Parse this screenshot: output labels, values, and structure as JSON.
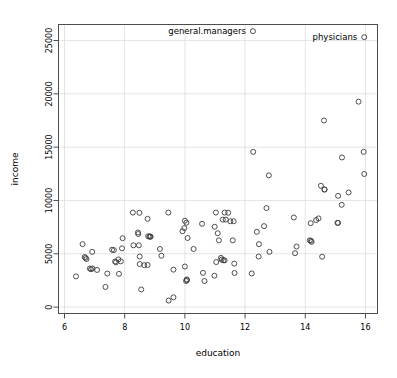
{
  "chart_data": {
    "type": "scatter",
    "title": "",
    "xlabel": "education",
    "ylabel": "income",
    "xlim": [
      5.8,
      16.4
    ],
    "ylim": [
      -600,
      26500
    ],
    "grid": true,
    "legend": "none",
    "xticks": [
      "6",
      "8",
      "10",
      "12",
      "14",
      "16"
    ],
    "xtick_values": [
      6,
      8,
      10,
      12,
      14,
      16
    ],
    "yticks": [
      "0",
      "5000",
      "10000",
      "15000",
      "20000",
      "25000"
    ],
    "ytick_values": [
      0,
      5000,
      10000,
      15000,
      20000,
      25000
    ],
    "marker": "open-circle",
    "marker_color": "#3c3c3c",
    "grid_color": "#d9d9d9",
    "frame_color": "#4d4d4d",
    "annotations": [
      {
        "text": "general.managers",
        "x": 12.26,
        "y": 25879
      },
      {
        "text": "physicians",
        "x": 15.96,
        "y": 25308
      }
    ],
    "points": [
      {
        "x": 12.26,
        "y": 25879
      },
      {
        "x": 15.96,
        "y": 25308
      },
      {
        "x": 15.77,
        "y": 19263
      },
      {
        "x": 14.62,
        "y": 17498
      },
      {
        "x": 12.27,
        "y": 14558
      },
      {
        "x": 15.94,
        "y": 14558
      },
      {
        "x": 15.22,
        "y": 14032
      },
      {
        "x": 12.79,
        "y": 12351
      },
      {
        "x": 15.96,
        "y": 12480
      },
      {
        "x": 14.52,
        "y": 11377
      },
      {
        "x": 14.64,
        "y": 11023
      },
      {
        "x": 14.64,
        "y": 11030
      },
      {
        "x": 15.09,
        "y": 10432
      },
      {
        "x": 15.44,
        "y": 10748
      },
      {
        "x": 15.21,
        "y": 9593
      },
      {
        "x": 12.71,
        "y": 9284
      },
      {
        "x": 11.03,
        "y": 8865
      },
      {
        "x": 11.32,
        "y": 8865
      },
      {
        "x": 11.44,
        "y": 8845
      },
      {
        "x": 8.27,
        "y": 8865
      },
      {
        "x": 8.49,
        "y": 8845
      },
      {
        "x": 9.45,
        "y": 8865
      },
      {
        "x": 13.62,
        "y": 8403
      },
      {
        "x": 8.76,
        "y": 8280
      },
      {
        "x": 10.0,
        "y": 8100
      },
      {
        "x": 10.05,
        "y": 7914
      },
      {
        "x": 14.44,
        "y": 8316
      },
      {
        "x": 14.36,
        "y": 8163
      },
      {
        "x": 14.18,
        "y": 7870
      },
      {
        "x": 11.51,
        "y": 8049
      },
      {
        "x": 11.62,
        "y": 8049
      },
      {
        "x": 11.26,
        "y": 8202
      },
      {
        "x": 11.36,
        "y": 8202
      },
      {
        "x": 10.57,
        "y": 7811
      },
      {
        "x": 15.07,
        "y": 7902
      },
      {
        "x": 15.09,
        "y": 7894
      },
      {
        "x": 10.99,
        "y": 7534
      },
      {
        "x": 9.98,
        "y": 7405
      },
      {
        "x": 9.92,
        "y": 7113
      },
      {
        "x": 12.39,
        "y": 7059
      },
      {
        "x": 12.63,
        "y": 7595
      },
      {
        "x": 8.44,
        "y": 6998
      },
      {
        "x": 8.45,
        "y": 6853
      },
      {
        "x": 8.78,
        "y": 6640
      },
      {
        "x": 8.82,
        "y": 6607
      },
      {
        "x": 8.85,
        "y": 6621
      },
      {
        "x": 8.86,
        "y": 6598
      },
      {
        "x": 11.09,
        "y": 6929
      },
      {
        "x": 14.15,
        "y": 6258
      },
      {
        "x": 14.21,
        "y": 6112
      },
      {
        "x": 14.19,
        "y": 6222
      },
      {
        "x": 11.13,
        "y": 6259
      },
      {
        "x": 11.59,
        "y": 6259
      },
      {
        "x": 10.09,
        "y": 6477
      },
      {
        "x": 7.93,
        "y": 6462
      },
      {
        "x": 12.46,
        "y": 5902
      },
      {
        "x": 6.6,
        "y": 5902
      },
      {
        "x": 13.71,
        "y": 5681
      },
      {
        "x": 8.29,
        "y": 5795
      },
      {
        "x": 7.91,
        "y": 5511
      },
      {
        "x": 6.92,
        "y": 5180
      },
      {
        "x": 7.58,
        "y": 5381
      },
      {
        "x": 7.64,
        "y": 5342
      },
      {
        "x": 8.47,
        "y": 5795
      },
      {
        "x": 10.29,
        "y": 5449
      },
      {
        "x": 9.17,
        "y": 5449
      },
      {
        "x": 12.81,
        "y": 5180
      },
      {
        "x": 13.66,
        "y": 5052
      },
      {
        "x": 6.67,
        "y": 4696
      },
      {
        "x": 6.7,
        "y": 4614
      },
      {
        "x": 6.73,
        "y": 4504
      },
      {
        "x": 12.45,
        "y": 4741
      },
      {
        "x": 14.56,
        "y": 4723
      },
      {
        "x": 8.5,
        "y": 4741
      },
      {
        "x": 7.68,
        "y": 4279
      },
      {
        "x": 7.71,
        "y": 4199
      },
      {
        "x": 7.79,
        "y": 4472
      },
      {
        "x": 7.87,
        "y": 4289
      },
      {
        "x": 9.22,
        "y": 4816
      },
      {
        "x": 11.2,
        "y": 4614
      },
      {
        "x": 11.22,
        "y": 4457
      },
      {
        "x": 11.28,
        "y": 4385
      },
      {
        "x": 11.32,
        "y": 4383
      },
      {
        "x": 11.04,
        "y": 4225
      },
      {
        "x": 11.64,
        "y": 4078
      },
      {
        "x": 8.5,
        "y": 4036
      },
      {
        "x": 8.65,
        "y": 3930
      },
      {
        "x": 8.76,
        "y": 3946
      },
      {
        "x": 10.0,
        "y": 3804
      },
      {
        "x": 6.84,
        "y": 3617
      },
      {
        "x": 6.88,
        "y": 3553
      },
      {
        "x": 6.93,
        "y": 3617
      },
      {
        "x": 7.08,
        "y": 3485
      },
      {
        "x": 9.62,
        "y": 3511
      },
      {
        "x": 12.22,
        "y": 3148
      },
      {
        "x": 11.65,
        "y": 3199
      },
      {
        "x": 10.6,
        "y": 3211
      },
      {
        "x": 10.98,
        "y": 2944
      },
      {
        "x": 7.42,
        "y": 3146
      },
      {
        "x": 7.81,
        "y": 3116
      },
      {
        "x": 6.38,
        "y": 2880
      },
      {
        "x": 10.65,
        "y": 2448
      },
      {
        "x": 10.04,
        "y": 2448
      },
      {
        "x": 10.06,
        "y": 2594
      },
      {
        "x": 10.07,
        "y": 2535
      },
      {
        "x": 7.36,
        "y": 1890
      },
      {
        "x": 8.55,
        "y": 1656
      },
      {
        "x": 9.46,
        "y": 611
      },
      {
        "x": 9.62,
        "y": 918
      }
    ]
  }
}
